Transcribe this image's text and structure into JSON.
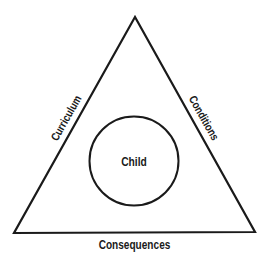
{
  "diagram": {
    "center_label": "Child",
    "sides": {
      "left": "Curriculum",
      "right": "Conditions",
      "bottom": "Consequences"
    },
    "colors": {
      "stroke": "#1a1a1a",
      "background": "#ffffff"
    }
  }
}
